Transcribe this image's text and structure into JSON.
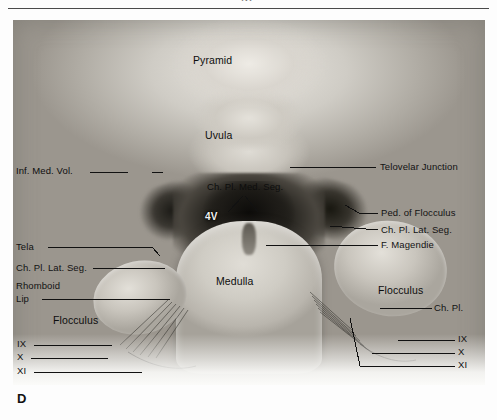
{
  "page": {
    "running_head_fragment": "gy",
    "panel_letter": "D",
    "figure_kind": "anatomical-dissection-photograph"
  },
  "plate": {
    "caption_letter": "D",
    "region": "Fourth ventricle / cerebellomedullary region"
  },
  "labels": {
    "pyramid": "Pyramid",
    "uvula": "Uvula",
    "inf_med_vol": "Inf. Med. Vol.",
    "ch_pl_med_seg": "Ch. Pl. Med. Seg.",
    "fourth_ventricle": "4V",
    "telovelar_junction": "Telovelar Junction",
    "ped_of_flocculus": "Ped. of Flocculus",
    "ch_pl_lat_seg_right": "Ch. Pl. Lat. Seg.",
    "f_magendie": "F. Magendie",
    "tela": "Tela",
    "ch_pl_lat_seg_left": "Ch. Pl. Lat. Seg.",
    "rhomboid": "Rhomboid",
    "lip": "Lip",
    "flocculus_left": "Flocculus",
    "flocculus_right": "Flocculus",
    "ch_pl_right": "Ch. Pl.",
    "medulla": "Medulla",
    "nerve_ix_left": "IX",
    "nerve_x_left": "X",
    "nerve_xi_left": "XI",
    "nerve_ix_right": "IX",
    "nerve_x_right": "X",
    "nerve_xi_right": "XI"
  },
  "colors": {
    "page_background": "#fdfdfd",
    "label_text": "#121212",
    "leader_line": "#111111",
    "rule": "#4a4a4a",
    "photo_mid_gray": "#b9b8b4",
    "photo_dark": "#1a1915"
  }
}
